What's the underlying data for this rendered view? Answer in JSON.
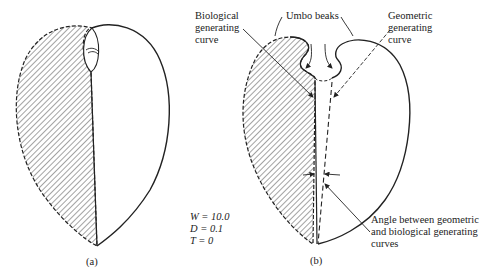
{
  "figure": {
    "panel_a": {
      "caption": "(a)"
    },
    "panel_b": {
      "caption": "(b)",
      "labels": {
        "biological_line1": "Biological",
        "biological_line2": "generating",
        "biological_line3": "curve",
        "umbo": "Umbo beaks",
        "geometric_line1": "Geometric",
        "geometric_line2": "generating",
        "geometric_line3": "curve",
        "angle_line1": "Angle between geometric",
        "angle_line2": "and biological generating",
        "angle_line3": "curves"
      },
      "params": {
        "w": "W = 10.0",
        "d": "D = 0.1",
        "t": "T = 0"
      }
    },
    "colors": {
      "ink": "#222222",
      "background": "#ffffff"
    }
  }
}
